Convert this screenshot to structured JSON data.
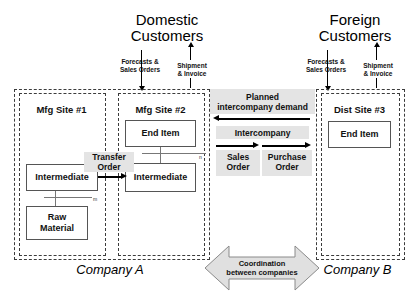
{
  "diagram": {
    "customers": [
      {
        "id": "domestic",
        "line1": "Domestic",
        "line2": "Customers"
      },
      {
        "id": "foreign",
        "line1": "Foreign",
        "line2": "Customers"
      }
    ],
    "flows": {
      "inbound_label_line1": "Forecasts &",
      "inbound_label_line2": "Sales Orders",
      "outbound_label_line1": "Shipment",
      "outbound_label_line2": "& Invoice"
    },
    "companies": [
      {
        "id": "a",
        "caption": "Company A"
      },
      {
        "id": "b",
        "caption": "Company B"
      }
    ],
    "sites": [
      {
        "id": "mfg1",
        "title": "Mfg Site #1",
        "items": [
          {
            "label": "Intermediate"
          },
          {
            "label": "Raw\nMaterial"
          }
        ],
        "bom_multiplier": "m"
      },
      {
        "id": "mfg2",
        "title": "Mfg Site #2",
        "items": [
          {
            "label": "End Item"
          },
          {
            "label": "Intermediate"
          }
        ],
        "bom_multiplier": "n"
      },
      {
        "id": "dist3",
        "title": "Dist Site #3",
        "items": [
          {
            "label": "End Item"
          }
        ],
        "bom_multiplier": ""
      }
    ],
    "transfer_order": {
      "line1": "Transfer",
      "line2": "Order"
    },
    "intercompany": {
      "planned_demand_line1": "Planned",
      "planned_demand_line2": "intercompany demand",
      "header": "Intercompany",
      "sales_order_line1": "Sales",
      "sales_order_line2": "Order",
      "purchase_order_line1": "Purchase",
      "purchase_order_line2": "Order"
    },
    "coordination": {
      "line1": "Coordination",
      "line2": "between companies"
    },
    "colors": {
      "band_grey": "#e4e4e4",
      "arrow_grey_fill": "#e0e0e0",
      "arrow_grey_stroke": "#8a8a8a",
      "box_stroke": "#555555",
      "dashed_stroke": "#3b3b3b"
    }
  }
}
